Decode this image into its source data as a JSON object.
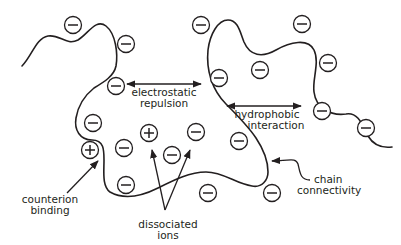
{
  "diagram": {
    "type": "polyelectrolyte-interactions",
    "colors": {
      "stroke": "#231f20",
      "background": "#ffffff"
    },
    "labels": {
      "electrostatic": [
        "electrostatic",
        "repulsion"
      ],
      "hydrophobic": [
        "hydrophobic",
        "interaction"
      ],
      "chain": [
        "chain",
        "connectivity"
      ],
      "counterion": [
        "counterion",
        "binding"
      ],
      "dissociated": [
        "dissociated",
        "ions"
      ]
    },
    "ions": [
      {
        "x": 73,
        "y": 25,
        "sign": "minus"
      },
      {
        "x": 126,
        "y": 44,
        "sign": "minus"
      },
      {
        "x": 116,
        "y": 86,
        "sign": "minus"
      },
      {
        "x": 93,
        "y": 123,
        "sign": "minus"
      },
      {
        "x": 90,
        "y": 150,
        "sign": "plus"
      },
      {
        "x": 124,
        "y": 148,
        "sign": "minus"
      },
      {
        "x": 149,
        "y": 133,
        "sign": "plus"
      },
      {
        "x": 172,
        "y": 155,
        "sign": "minus"
      },
      {
        "x": 196,
        "y": 132,
        "sign": "minus"
      },
      {
        "x": 126,
        "y": 185,
        "sign": "minus"
      },
      {
        "x": 201,
        "y": 25,
        "sign": "minus"
      },
      {
        "x": 219,
        "y": 78,
        "sign": "minus"
      },
      {
        "x": 260,
        "y": 70,
        "sign": "minus"
      },
      {
        "x": 302,
        "y": 24,
        "sign": "minus"
      },
      {
        "x": 328,
        "y": 63,
        "sign": "minus"
      },
      {
        "x": 322,
        "y": 111,
        "sign": "minus"
      },
      {
        "x": 239,
        "y": 141,
        "sign": "minus"
      },
      {
        "x": 208,
        "y": 193,
        "sign": "minus"
      },
      {
        "x": 272,
        "y": 193,
        "sign": "minus"
      },
      {
        "x": 366,
        "y": 128,
        "sign": "minus"
      }
    ]
  }
}
